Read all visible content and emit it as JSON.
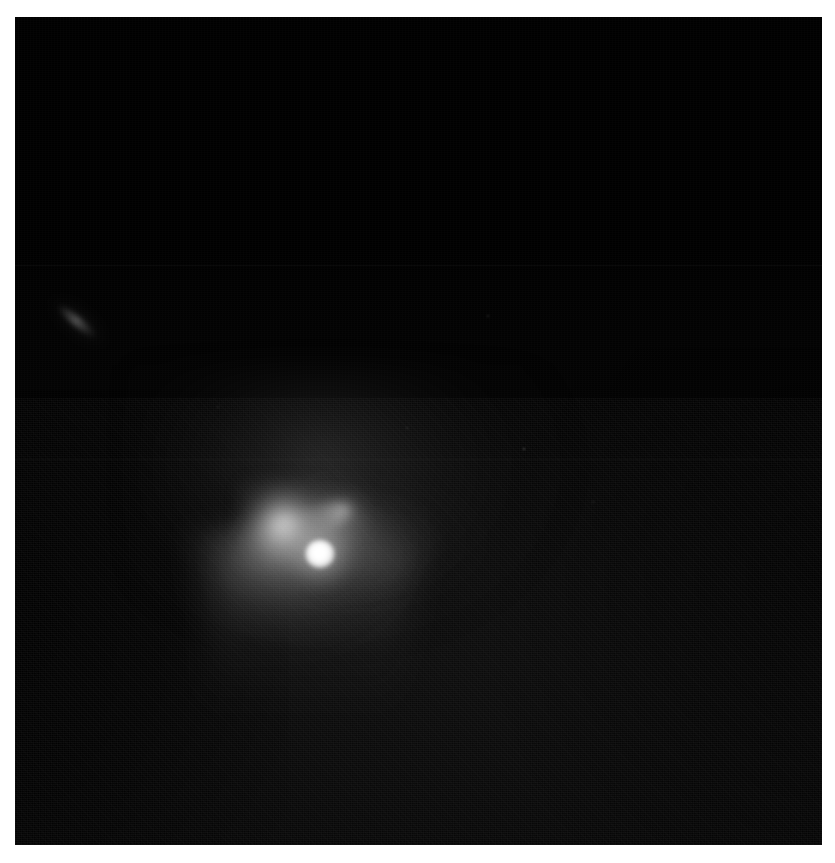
{
  "image": {
    "kind": "astronomical-observation",
    "subject": "comet-like object with bright nucleus, fan coma and jet",
    "plate_background_color": "#010101",
    "frame_background_color": "#ffffff",
    "dimensions": {
      "width": 835,
      "height": 863
    },
    "plate": {
      "left": 15,
      "top": 17,
      "width": 807,
      "height": 828
    }
  },
  "features": {
    "nucleus": {
      "name": "bright-nucleus",
      "x_pct": 37.8,
      "y_pct": 64.8,
      "color": "#ffffff",
      "note": "saturated point source"
    },
    "coma": {
      "name": "fan-coma",
      "direction": "down-and-right",
      "note": "broad diffuse fan spreading from nucleus"
    },
    "jet": {
      "name": "jet-spike",
      "direction": "up-and-left",
      "angle_deg": -22,
      "note": "narrow linear jet from nucleus"
    },
    "dust_tail": {
      "name": "dust-tail",
      "direction": "downward",
      "note": "diffuse tail fading toward lower frame"
    },
    "streak": {
      "name": "background-streak",
      "x_pct": 6.5,
      "y_pct": 37.5,
      "angle_deg": 40,
      "note": "faint elongated background source upper-left"
    }
  },
  "artifacts": {
    "seams": [
      {
        "name": "detector-seam-upper",
        "y_pct": 30.0
      },
      {
        "name": "detector-seam-lower",
        "y_pct": 53.4
      }
    ],
    "grain": {
      "name": "detector-noise",
      "note": "visible read noise / grain texture, stronger in lower half"
    },
    "hot_pixels": [
      {
        "x_pct": 63.0,
        "y_pct": 52.0
      },
      {
        "x_pct": 58.5,
        "y_pct": 36.0
      },
      {
        "x_pct": 48.5,
        "y_pct": 49.5
      },
      {
        "x_pct": 71.5,
        "y_pct": 58.5
      },
      {
        "x_pct": 25.0,
        "y_pct": 47.0
      }
    ]
  }
}
